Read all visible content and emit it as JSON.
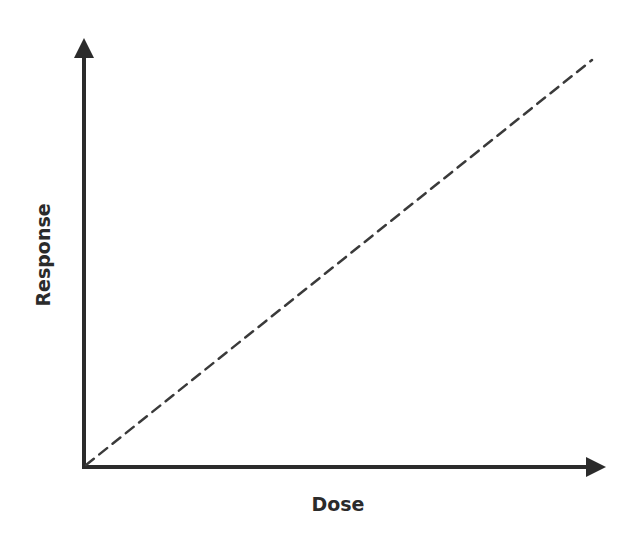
{
  "chart_data": {
    "type": "line",
    "title": "",
    "xlabel": "Dose",
    "ylabel": "Response",
    "grid": false,
    "legend": null,
    "ticks": {
      "x": [],
      "y": []
    },
    "xlim": [
      0,
      1
    ],
    "ylim": [
      0,
      1
    ],
    "series": [
      {
        "name": "linear dose-response",
        "style": "dashed",
        "x": [
          0,
          1
        ],
        "y": [
          0,
          1
        ]
      }
    ],
    "annotations": []
  },
  "colors": {
    "axis": "#2b2b2b",
    "line": "#3a3a3a",
    "background": "#ffffff"
  }
}
